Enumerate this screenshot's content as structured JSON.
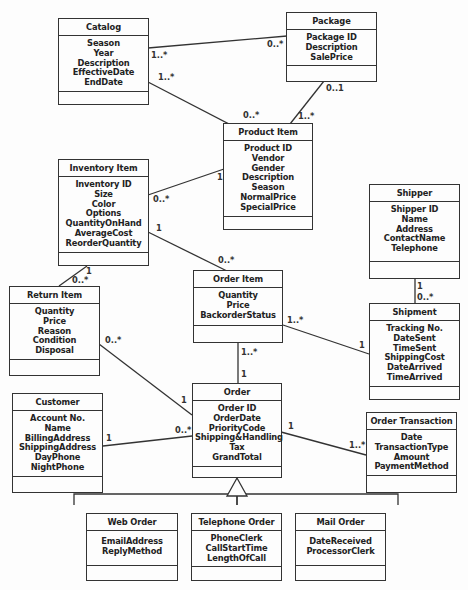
{
  "diagram": {
    "type": "UML class diagram",
    "classes": {
      "catalog": {
        "name": "Catalog",
        "attributes": [
          "Season",
          "Year",
          "Description",
          "EffectiveDate",
          "EndDate"
        ]
      },
      "package": {
        "name": "Package",
        "attributes": [
          "Package ID",
          "Description",
          "SalePrice"
        ]
      },
      "product_item": {
        "name": "Product Item",
        "attributes": [
          "Product ID",
          "Vendor",
          "Gender",
          "Description",
          "Season",
          "NormalPrice",
          "SpecialPrice"
        ]
      },
      "inventory_item": {
        "name": "Inventory Item",
        "attributes": [
          "Inventory ID",
          "Size",
          "Color",
          "Options",
          "QuantityOnHand",
          "AverageCost",
          "ReorderQuantity"
        ]
      },
      "shipper": {
        "name": "Shipper",
        "attributes": [
          "Shipper ID",
          "Name",
          "Address",
          "ContactName",
          "Telephone"
        ]
      },
      "order_item": {
        "name": "Order Item",
        "attributes": [
          "Quantity",
          "Price",
          "BackorderStatus"
        ]
      },
      "return_item": {
        "name": "Return Item",
        "attributes": [
          "Quantity",
          "Price",
          "Reason",
          "Condition",
          "Disposal"
        ]
      },
      "shipment": {
        "name": "Shipment",
        "attributes": [
          "Tracking No.",
          "DateSent",
          "TimeSent",
          "ShippingCost",
          "DateArrived",
          "TimeArrived"
        ]
      },
      "customer": {
        "name": "Customer",
        "attributes": [
          "Account No.",
          "Name",
          "BillingAddress",
          "ShippingAddress",
          "DayPhone",
          "NightPhone"
        ]
      },
      "order": {
        "name": "Order",
        "attributes": [
          "Order ID",
          "OrderDate",
          "PriorityCode",
          "Shipping&Handling",
          "Tax",
          "GrandTotal"
        ]
      },
      "order_transaction": {
        "name": "Order Transaction",
        "attributes": [
          "Date",
          "TransactionType",
          "Amount",
          "PaymentMethod"
        ]
      },
      "web_order": {
        "name": "Web Order",
        "attributes": [
          "EmailAddress",
          "ReplyMethod"
        ]
      },
      "telephone_order": {
        "name": "Telephone Order",
        "attributes": [
          "PhoneClerk",
          "CallStartTime",
          "LengthOfCall"
        ]
      },
      "mail_order": {
        "name": "Mail Order",
        "attributes": [
          "DateReceived",
          "ProcessorClerk"
        ]
      }
    },
    "multiplicities": {
      "catalog_package_catalog_end": "1..*",
      "catalog_package_package_end": "0..*",
      "catalog_product_catalog_end": "1..*",
      "catalog_product_product_end": "0..*",
      "package_product_package_end": "0..1",
      "package_product_product_end": "1..*",
      "inventory_product_inventory_end": "0..*",
      "inventory_product_product_end": "1",
      "inventory_orderitem_inventory_end": "1",
      "inventory_orderitem_orderitem_end": "0..*",
      "inventory_return_inventory_end": "1",
      "inventory_return_return_end": "0..*",
      "shipper_shipment_shipper_end": "1",
      "shipper_shipment_shipment_end": "0..*",
      "orderitem_shipment_orderitem_end": "1..*",
      "orderitem_shipment_shipment_end": "1",
      "orderitem_order_orderitem_end": "1..*",
      "orderitem_order_order_end": "1",
      "return_order_return_end": "0..*",
      "return_order_order_end": "1",
      "customer_order_customer_end": "1",
      "customer_order_order_end": "0..*",
      "order_transaction_order_end": "1",
      "order_transaction_transaction_end": "1..*"
    }
  }
}
